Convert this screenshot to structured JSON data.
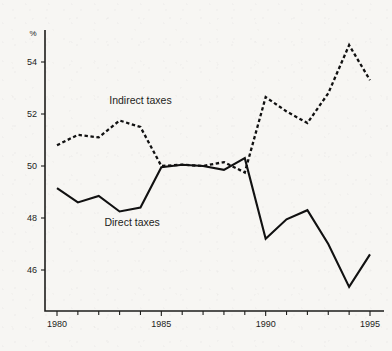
{
  "chart_data": {
    "type": "line",
    "title": "",
    "subtitle": "",
    "xlabel": "",
    "ylabel": "%",
    "unit_label": "%",
    "x": [
      1980,
      1981,
      1982,
      1983,
      1984,
      1985,
      1986,
      1987,
      1988,
      1989,
      1990,
      1991,
      1992,
      1993,
      1994,
      1995
    ],
    "xlim": [
      1980,
      1995
    ],
    "ylim": [
      44.6,
      55.4
    ],
    "x_tick_labels": [
      "1980",
      "1985",
      "1990",
      "1995"
    ],
    "x_major_ticks": [
      1980,
      1985,
      1990,
      1995
    ],
    "x_minor_ticks": [
      1981,
      1982,
      1983,
      1984,
      1986,
      1987,
      1988,
      1989,
      1991,
      1992,
      1993,
      1994
    ],
    "y_tick_labels": [
      "54",
      "52",
      "50",
      "48",
      "46"
    ],
    "y_ticks": [
      54,
      52,
      50,
      48,
      46
    ],
    "grid": false,
    "legend_position": "inline-annotation",
    "series": [
      {
        "name": "Indirect taxes",
        "style": "dashed",
        "color": "#111111",
        "label_x": 1984.0,
        "label_y": 52.4,
        "values": [
          50.8,
          51.2,
          51.1,
          51.75,
          51.5,
          50.0,
          50.05,
          50.0,
          50.15,
          49.75,
          52.65,
          52.1,
          51.65,
          52.8,
          54.65,
          53.3
        ]
      },
      {
        "name": "Direct taxes",
        "style": "solid",
        "color": "#111111",
        "label_x": 1983.6,
        "label_y": 47.7,
        "values": [
          49.15,
          48.6,
          48.85,
          48.25,
          48.4,
          49.95,
          50.05,
          50.0,
          49.85,
          50.3,
          47.2,
          47.95,
          48.3,
          47.0,
          45.35,
          46.6
        ]
      }
    ]
  }
}
